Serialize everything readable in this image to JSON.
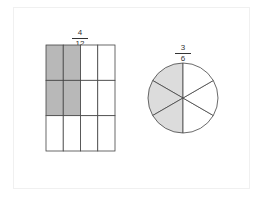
{
  "diagram": {
    "grid_fraction": {
      "numerator": "4",
      "denominator": "12"
    },
    "circle_fraction": {
      "numerator": "3",
      "denominator": "6"
    },
    "grid": {
      "rows": 3,
      "cols": 4,
      "shaded_cells": [
        [
          0,
          0
        ],
        [
          0,
          1
        ],
        [
          1,
          0
        ],
        [
          1,
          1
        ]
      ],
      "shade_color": "#b8b8b8"
    },
    "circle": {
      "slices": 6,
      "shaded_slices": 3,
      "shade_color": "#dcdcdc"
    },
    "line_color": "#444444"
  }
}
